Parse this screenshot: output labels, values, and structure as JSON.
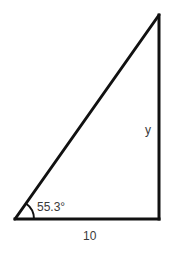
{
  "diagram": {
    "type": "right-triangle",
    "stroke_color": "#111111",
    "label_color": "#3a3a3a",
    "vertices": {
      "bottom_left": [
        15,
        219
      ],
      "bottom_right": [
        159,
        219
      ],
      "top_right": [
        159,
        15
      ]
    },
    "labels": {
      "angle": "55.3°",
      "opposite_side": "y",
      "adjacent_side": "10"
    },
    "right_angle_at": "bottom_right",
    "angle_marked_at": "bottom_left"
  }
}
